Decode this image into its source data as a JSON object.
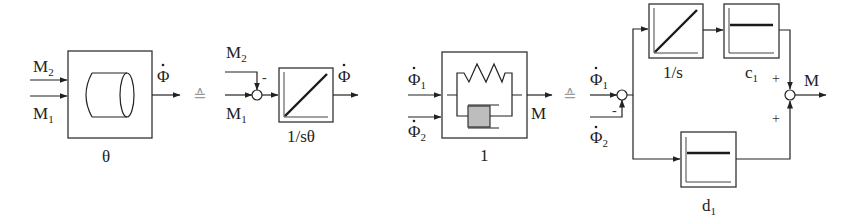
{
  "diagram": {
    "inertia_block": {
      "inputs": [
        "M",
        "M"
      ],
      "input_subscripts": [
        "2",
        "1"
      ],
      "output": "Φ",
      "parameter": "θ"
    },
    "equiv_symbol_1": "≙",
    "integrator_block": {
      "inputs": [
        "M",
        "M"
      ],
      "input_subscripts": [
        "2",
        "1"
      ],
      "sign_minus": "-",
      "output": "Φ",
      "parameter": "1/sθ"
    },
    "spring_damper_block": {
      "inputs": [
        "Φ",
        "Φ"
      ],
      "input_subscripts": [
        "1",
        "2"
      ],
      "output": "M",
      "parameter": "1"
    },
    "equiv_symbol_2": "≙",
    "parallel_model": {
      "inputs": [
        "Φ",
        "Φ"
      ],
      "input_subscripts": [
        "1",
        "2"
      ],
      "sign_minus": "-",
      "integrator_label": "1/s",
      "stiffness_label": "c",
      "stiffness_subscript": "1",
      "damping_label": "d",
      "damping_subscript": "1",
      "sign_plus_top": "+",
      "sign_plus_bottom": "+",
      "output": "M"
    }
  }
}
